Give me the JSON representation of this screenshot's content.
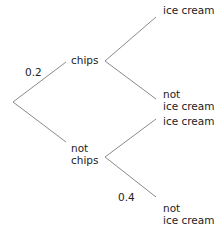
{
  "diagram": {
    "type": "probability-tree",
    "level1": [
      {
        "label": "chips",
        "probability": "0.2"
      },
      {
        "label_line1": "not",
        "label_line2": "chips",
        "probability": ""
      }
    ],
    "level2_chips": [
      {
        "label": "ice cream",
        "probability": ""
      },
      {
        "label_line1": "not",
        "label_line2": "ice cream",
        "probability": ""
      }
    ],
    "level2_not_chips": [
      {
        "label": "ice cream",
        "probability": ""
      },
      {
        "label_line1": "not",
        "label_line2": "ice cream",
        "probability": "0.4"
      }
    ]
  }
}
